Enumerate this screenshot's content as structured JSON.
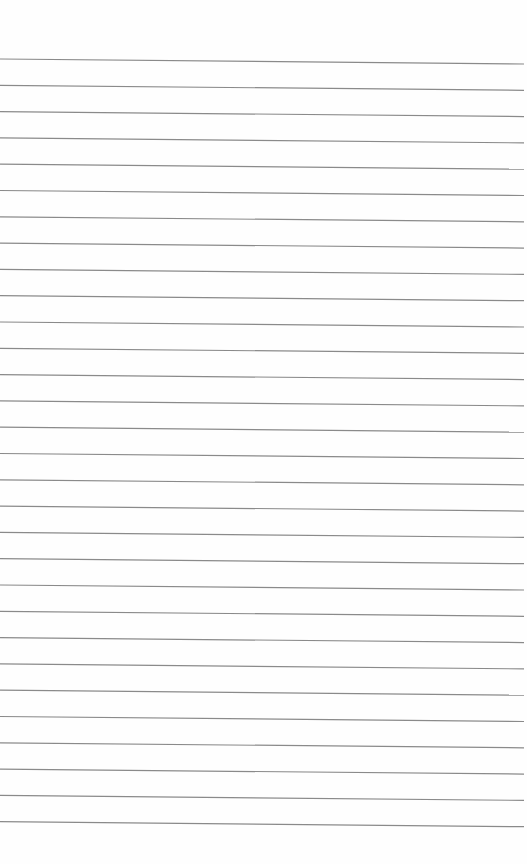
{
  "paper": {
    "type": "lined-paper",
    "background": "#fefefe",
    "line_color": "#8a8a8a",
    "line_count": 30,
    "first_line_y_left": 59,
    "first_line_y_right": 64,
    "line_spacing": 26.3,
    "line_x_start": 0,
    "line_x_end": 524,
    "line_width": 1.2
  }
}
